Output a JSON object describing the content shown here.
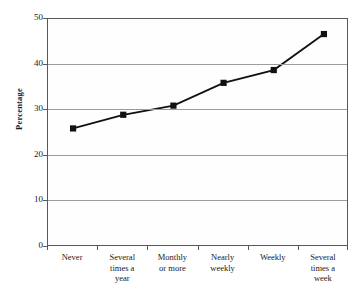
{
  "chart_data": {
    "type": "line",
    "title": "",
    "xlabel": "",
    "ylabel": "Percentage",
    "ylim": [
      0,
      50
    ],
    "yticks": [
      0,
      10,
      20,
      30,
      40,
      50
    ],
    "grid": true,
    "legend": "none",
    "marker": "filled-square",
    "line_color": "#111111",
    "marker_color": "#111111",
    "categories": [
      "Never",
      "Several times a year",
      "Monthly or more",
      "Nearly weekly",
      "Weekly",
      "Several times a week"
    ],
    "category_lines": [
      [
        "Never"
      ],
      [
        "Several",
        "times a",
        "year"
      ],
      [
        "Monthly",
        "or more"
      ],
      [
        "Nearly",
        "weekly"
      ],
      [
        "Weekly"
      ],
      [
        "Several",
        "times a",
        "week"
      ]
    ],
    "values": [
      26,
      29,
      31,
      36,
      38.8,
      46.7
    ],
    "series": [
      {
        "name": "Percentage",
        "values": [
          26,
          29,
          31,
          36,
          38.8,
          46.7
        ]
      }
    ]
  },
  "axis": {
    "y_tick_labels": [
      "50",
      "40",
      "30",
      "20",
      "10",
      "0"
    ],
    "y_title": "Percentage"
  }
}
